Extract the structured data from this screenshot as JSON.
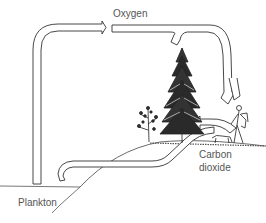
{
  "diagram": {
    "labels": {
      "oxygen": "Oxygen",
      "carbon_dioxide_line1": "Carbon",
      "carbon_dioxide_line2": "dioxide",
      "plankton": "Plankton"
    },
    "elements": [
      "plankton-water",
      "oxygen-arrow-from-plankton",
      "oxygen-arrow-from-tree",
      "oxygen-arrow-to-people",
      "carbon-dioxide-arrow-to-plankton",
      "carbon-dioxide-arrow-to-tree",
      "tall-conifer-tree",
      "small-tree",
      "hiker-with-dog",
      "hill-ground"
    ],
    "colors": {
      "line": "#333333",
      "fill": "#ffffff",
      "text": "#555555"
    }
  }
}
